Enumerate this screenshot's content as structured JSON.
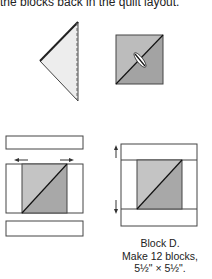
{
  "header": {
    "text": "the blocks back in the quilt layout."
  },
  "diagrams": {
    "folded_triangle": {
      "label": "folded-triangle",
      "fill": "#ededed"
    },
    "pressed_square": {
      "label": "pressed-square",
      "light": "#bcbcbc",
      "dark": "#a3a3a3"
    },
    "block_exploded": {
      "label": "block-assembly-exploded"
    },
    "block_finished": {
      "label": "block-d-finished"
    }
  },
  "caption": {
    "line1": "Block D.",
    "line2": "Make 12 blocks,",
    "line3": "5½\" × 5½\"."
  }
}
